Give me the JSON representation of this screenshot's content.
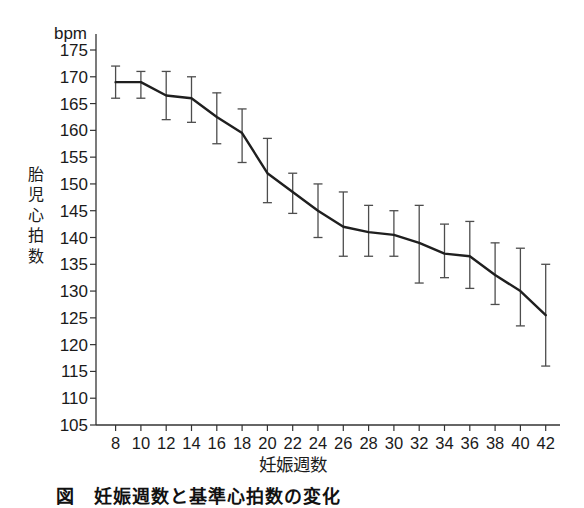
{
  "chart_data": {
    "type": "line",
    "title": "",
    "unit": "bpm",
    "xlabel": "妊娠週数",
    "ylabel": "胎児心拍数",
    "x": [
      8,
      10,
      12,
      14,
      16,
      18,
      20,
      22,
      24,
      26,
      28,
      30,
      32,
      34,
      36,
      38,
      40,
      42
    ],
    "series": [
      {
        "name": "胎児心拍数平均値",
        "values": [
          169,
          169,
          166.5,
          166,
          162.5,
          159.5,
          152,
          148.5,
          145,
          142,
          141,
          140.5,
          139,
          137,
          136.5,
          133,
          130,
          125.5
        ],
        "upper": [
          172,
          171,
          171,
          170,
          167,
          164,
          158.5,
          152,
          150,
          148.5,
          146,
          145,
          146,
          142.5,
          143,
          139,
          138,
          135
        ],
        "lower": [
          166,
          166,
          162,
          161.5,
          157.5,
          154,
          146.5,
          144.5,
          140,
          136.5,
          136.5,
          136.5,
          131.5,
          132.5,
          130.5,
          127.5,
          123.5,
          116
        ]
      }
    ],
    "error_bars": true,
    "xlim": [
      6.5,
      43.7
    ],
    "ylim": [
      105,
      175
    ],
    "xticks": [
      8,
      10,
      12,
      14,
      16,
      18,
      20,
      22,
      24,
      26,
      28,
      30,
      32,
      34,
      36,
      38,
      40,
      42
    ],
    "yticks": [
      105,
      110,
      115,
      120,
      125,
      130,
      135,
      140,
      145,
      150,
      155,
      160,
      165,
      170,
      175
    ],
    "grid": false,
    "legend": "none"
  },
  "caption": {
    "text": "図　妊娠週数と基準心拍数の変化"
  },
  "colors": {
    "background": "#ffffff",
    "line": "#1f1f1f",
    "error_bar": "#4d4d4d",
    "axis": "#333333",
    "text": "#1a1a1a"
  }
}
